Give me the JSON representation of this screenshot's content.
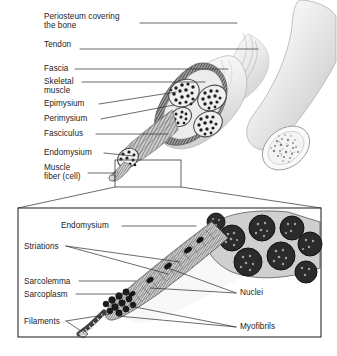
{
  "figure": {
    "background_color": "#ffffff",
    "line_color": "#3a3a3a",
    "text_color": "#1c1c1c"
  },
  "upper_panel": {
    "name": "whole-muscle-overview",
    "labels": [
      {
        "id": "periosteum",
        "text": "Periosteum covering\nthe bone",
        "x": 44,
        "y": 12
      },
      {
        "id": "tendon",
        "text": "Tendon",
        "x": 44,
        "y": 40
      },
      {
        "id": "fascia",
        "text": "Fascia",
        "x": 44,
        "y": 64
      },
      {
        "id": "skeletal-muscle",
        "text": "Skeletal\nmuscle",
        "x": 44,
        "y": 77
      },
      {
        "id": "epimysium",
        "text": "Epimysium",
        "x": 44,
        "y": 99
      },
      {
        "id": "perimysium",
        "text": "Perimysium",
        "x": 44,
        "y": 114
      },
      {
        "id": "fasciculus",
        "text": "Fasciculus",
        "x": 44,
        "y": 129
      },
      {
        "id": "endomysium",
        "text": "Endomysium",
        "x": 44,
        "y": 148
      },
      {
        "id": "muscle-fiber",
        "text": "Muscle\nfiber (cell)",
        "x": 44,
        "y": 163
      }
    ]
  },
  "lower_panel": {
    "name": "muscle-fiber-magnified-inset",
    "labels": [
      {
        "id": "endomysium-inset",
        "text": "Endomysium",
        "x": 61,
        "y": 221
      },
      {
        "id": "striations",
        "text": "Striations",
        "x": 24,
        "y": 242
      },
      {
        "id": "sarcolemma",
        "text": "Sarcolemma",
        "x": 24,
        "y": 277
      },
      {
        "id": "sarcoplasm",
        "text": "Sarcoplasm",
        "x": 24,
        "y": 290
      },
      {
        "id": "filaments",
        "text": "Filaments",
        "x": 24,
        "y": 317
      },
      {
        "id": "nuclei",
        "text": "Nuclei",
        "x": 240,
        "y": 288
      },
      {
        "id": "myofibrils",
        "text": "Myofibrils",
        "x": 240,
        "y": 322
      }
    ]
  }
}
